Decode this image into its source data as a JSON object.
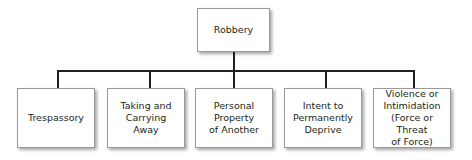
{
  "diagram": {
    "type": "tree",
    "root": {
      "label": "Robbery"
    },
    "children": [
      {
        "label": "Trespassory"
      },
      {
        "label": "Taking and\nCarrying\nAway"
      },
      {
        "label": "Personal\nProperty\nof Another"
      },
      {
        "label": "Intent to\nPermanently\nDeprive"
      },
      {
        "label": "Violence or\nIntimidation\n(Force or Threat\nof Force)"
      }
    ]
  }
}
